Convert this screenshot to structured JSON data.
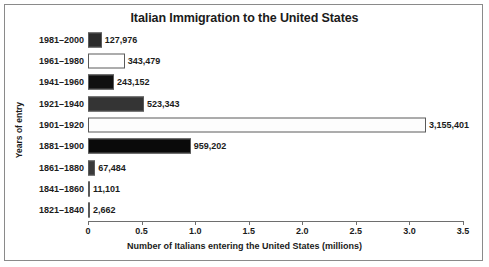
{
  "figure": {
    "frame_color": "#8a8a8a",
    "background": "#ffffff"
  },
  "chart_data": {
    "type": "bar",
    "orientation": "horizontal",
    "title": "Italian Immigration to the United States",
    "xlabel": "Number of Italians entering the United States (millions)",
    "ylabel": "Years of entry",
    "xlim": [
      0,
      3.5
    ],
    "xticks": [
      "0",
      "0.5",
      "1.0",
      "1.5",
      "2.0",
      "2.5",
      "3.0",
      "3.5"
    ],
    "xtick_values": [
      0,
      0.5,
      1.0,
      1.5,
      2.0,
      2.5,
      3.0,
      3.5
    ],
    "grid": false,
    "legend": "none",
    "categories": [
      "1981–2000",
      "1961–1980",
      "1941–1960",
      "1921–1940",
      "1901–1920",
      "1881–1900",
      "1861–1880",
      "1841–1860",
      "1821–1840"
    ],
    "values": [
      127976,
      343479,
      243152,
      523343,
      3155401,
      959202,
      67484,
      11101,
      2662
    ],
    "value_labels": [
      "127,976",
      "343,479",
      "243,152",
      "523,343",
      "3,155,401",
      "959,202",
      "67,484",
      "11,101",
      "2,662"
    ],
    "bar_fills": [
      "#2b2b2b",
      "#ffffff",
      "#101010",
      "#343434",
      "#fdfdfd",
      "#0a0a0a",
      "#3a3a3a",
      "#7a7a7a",
      "#8c8c8c"
    ],
    "bar_edge_color": "#5a5a5a"
  }
}
